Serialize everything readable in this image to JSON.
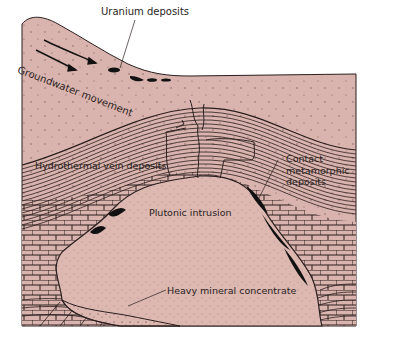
{
  "figure": {
    "type": "geologic-cross-section",
    "colors": {
      "background": "#ffffff",
      "rock_fill": "#d9b3ad",
      "intrusion_fill": "#dcb8b1",
      "ink": "#2a1e1e",
      "ore_black": "#111111"
    }
  },
  "labels": {
    "uranium": "Uranium deposits",
    "groundwater": "Groundwater movement",
    "hydrothermal": "Hydrothermal vein deposits",
    "contact_line1": "Contact",
    "contact_line2": "metamorphic",
    "contact_line3": "deposits",
    "plutonic": "Plutonic intrusion",
    "heavy": "Heavy mineral concentrate"
  },
  "features": [
    {
      "name": "groundwater-arrows",
      "count": 2,
      "direction": "down-right along slope"
    },
    {
      "name": "uranium-lenses",
      "count": 4
    },
    {
      "name": "folded-strata",
      "description": "anticline of thin sedimentary layers draped over intrusion"
    },
    {
      "name": "hydrothermal-veins",
      "description": "fractures cutting strata above intrusion crest"
    },
    {
      "name": "contact-zone",
      "description": "black ore bodies along intrusion margin in brick-pattern limestone"
    },
    {
      "name": "plutonic-intrusion",
      "description": "stippled igneous body"
    },
    {
      "name": "heavy-mineral-concentrate",
      "description": "dark stippled layer at base of intrusion"
    }
  ]
}
